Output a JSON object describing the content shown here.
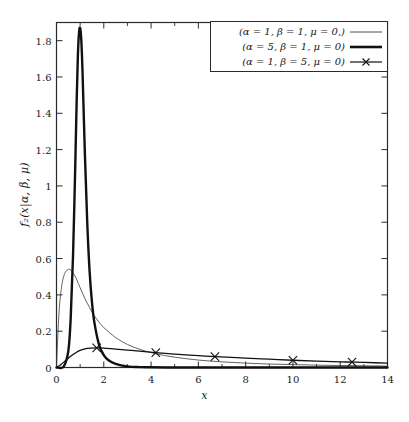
{
  "chart_data": {
    "type": "line",
    "title": "",
    "xlabel": "x",
    "ylabel": "f₂(x|α, β, μ)",
    "xlim": [
      0,
      14
    ],
    "ylim": [
      0,
      1.9
    ],
    "xticks": [
      0,
      2,
      4,
      6,
      8,
      10,
      12,
      14
    ],
    "xtick_labels": [
      "0",
      "2",
      "4",
      "6",
      "8",
      "10",
      "12",
      "14"
    ],
    "xminor_ticks": [
      1,
      3,
      5,
      7,
      9,
      11,
      13
    ],
    "yticks": [
      0,
      0.2,
      0.4,
      0.6,
      0.8,
      1,
      1.2,
      1.4,
      1.6,
      1.8
    ],
    "ytick_labels": [
      "0",
      "0.2",
      "0.4",
      "0.6",
      "0.8",
      "1",
      "1.2",
      "1.4",
      "1.6",
      "1.8"
    ],
    "grid": false,
    "legend_position": "top-right",
    "frame": true,
    "series": [
      {
        "name": "(α = 1, β = 1, μ = 0,)",
        "alpha": 1,
        "beta": 1,
        "mu": 0,
        "style": "thin",
        "color": "#3a3a3a",
        "linewidth": 0.8,
        "marker": "none",
        "x": [
          0,
          0.1,
          0.2,
          0.3,
          0.4,
          0.5,
          0.55,
          0.6,
          0.7,
          0.8,
          0.9,
          1.0,
          1.2,
          1.4,
          1.6,
          1.8,
          2.0,
          2.5,
          3.0,
          3.5,
          4.0,
          4.5,
          5.0,
          6.0,
          7.0,
          8.0,
          9.0,
          10.0,
          11.0,
          12.0,
          13.0,
          14.0
        ],
        "y": [
          0.0,
          0.29,
          0.43,
          0.5,
          0.53,
          0.54,
          0.541,
          0.538,
          0.52,
          0.5,
          0.47,
          0.44,
          0.38,
          0.33,
          0.285,
          0.25,
          0.22,
          0.165,
          0.127,
          0.101,
          0.082,
          0.068,
          0.057,
          0.041,
          0.031,
          0.024,
          0.019,
          0.016,
          0.013,
          0.011,
          0.0095,
          0.008
        ]
      },
      {
        "name": "(α = 5, β = 1, μ = 0)",
        "alpha": 5,
        "beta": 1,
        "mu": 0,
        "style": "thick",
        "color": "#111111",
        "linewidth": 2.4,
        "marker": "none",
        "x": [
          0,
          0.3,
          0.5,
          0.6,
          0.7,
          0.8,
          0.85,
          0.9,
          0.95,
          1.0,
          1.05,
          1.1,
          1.2,
          1.3,
          1.4,
          1.5,
          1.6,
          1.8,
          2.0,
          2.2,
          2.5,
          3.0,
          3.5,
          4.0,
          5.0,
          6.0,
          8.0,
          10.0,
          12.0,
          14.0
        ],
        "y": [
          0.0,
          0.005,
          0.09,
          0.27,
          0.62,
          1.15,
          1.45,
          1.7,
          1.84,
          1.87,
          1.8,
          1.63,
          1.18,
          0.8,
          0.53,
          0.36,
          0.25,
          0.125,
          0.068,
          0.04,
          0.02,
          0.006,
          0.002,
          0.001,
          0.0,
          0.0,
          0.0,
          0.0,
          0.0,
          0.0
        ]
      },
      {
        "name": "(α = 1, β = 5, μ = 0)",
        "alpha": 1,
        "beta": 5,
        "mu": 0,
        "style": "marked",
        "color": "#111111",
        "linewidth": 1.3,
        "marker": "x",
        "marker_x": [
          1.7,
          4.2,
          6.7,
          10.0,
          12.5
        ],
        "marker_y": [
          0.108,
          0.082,
          0.06,
          0.04,
          0.03
        ],
        "x": [
          0,
          0.2,
          0.4,
          0.6,
          0.8,
          1.0,
          1.3,
          1.7,
          2.0,
          2.5,
          3.0,
          3.5,
          4.2,
          5.0,
          6.0,
          6.7,
          8.0,
          9.0,
          10.0,
          11.0,
          12.0,
          12.5,
          13.0,
          14.0
        ],
        "y": [
          0.0,
          0.018,
          0.04,
          0.062,
          0.08,
          0.094,
          0.105,
          0.108,
          0.107,
          0.101,
          0.096,
          0.09,
          0.082,
          0.074,
          0.065,
          0.06,
          0.052,
          0.046,
          0.04,
          0.035,
          0.031,
          0.03,
          0.028,
          0.024
        ]
      }
    ]
  },
  "legend": {
    "entries": [
      {
        "label": "(α = 1, β = 1, μ = 0,)",
        "swatch": "thin-line-swatch"
      },
      {
        "label": "(α = 5, β = 1, μ = 0)",
        "swatch": "thick-line-swatch"
      },
      {
        "label": "(α = 1, β = 5, μ = 0)",
        "swatch": "marked-line-swatch"
      }
    ]
  },
  "colors": {
    "frame": "#2a2a2a",
    "thin_curve": "#3a3a3a",
    "thick_curve": "#111111",
    "marked_curve": "#111111",
    "background": "#ffffff"
  }
}
